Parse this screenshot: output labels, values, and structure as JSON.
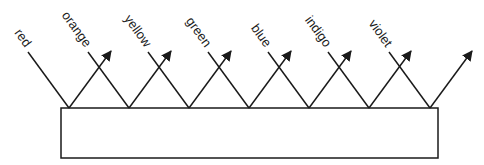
{
  "diagram": {
    "type": "reflection-diagram",
    "surface": {
      "x": 61,
      "y": 108,
      "width": 377,
      "height": 50
    },
    "rays": [
      {
        "label": "red",
        "hit_x": 69
      },
      {
        "label": "orange",
        "hit_x": 129
      },
      {
        "label": "yellow",
        "hit_x": 189
      },
      {
        "label": "green",
        "hit_x": 249
      },
      {
        "label": "blue",
        "hit_x": 309
      },
      {
        "label": "indigo",
        "hit_x": 369
      },
      {
        "label": "violet",
        "hit_x": 430
      }
    ],
    "line_color": "#1a1a1a"
  }
}
